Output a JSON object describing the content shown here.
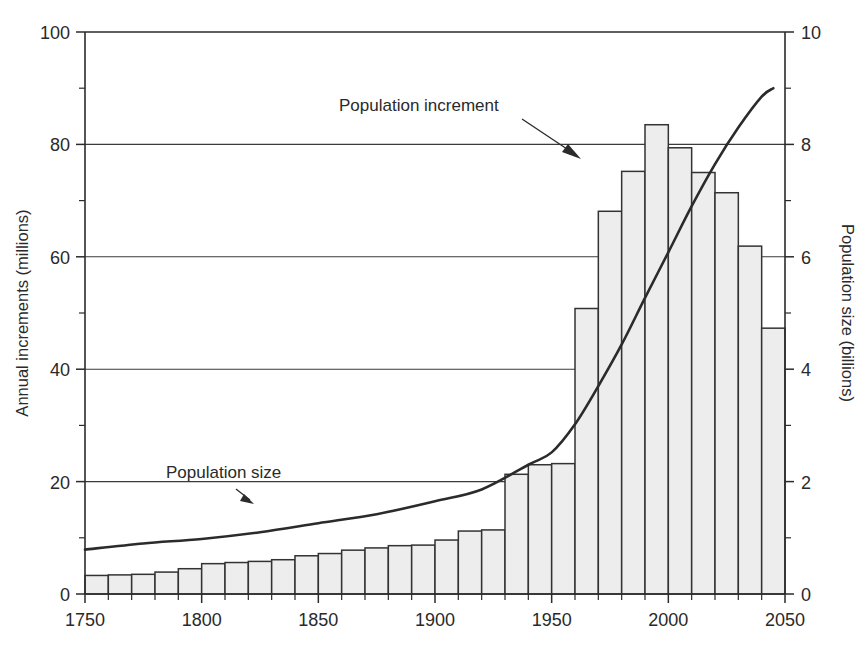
{
  "chart_data": {
    "type": "bar",
    "title": "",
    "subtitle": "",
    "xlabel": "",
    "ylabel": "Annual increments (millions)",
    "y2label": "Population size (billions)",
    "xlim": [
      1750,
      2050
    ],
    "ylim": [
      0,
      100
    ],
    "y2lim": [
      0,
      10
    ],
    "grid": true,
    "legend_position": "annotations-on-plot",
    "x_ticks": [
      1750,
      1800,
      1850,
      1900,
      1950,
      2000,
      2050
    ],
    "x_tick_labels": [
      "1750",
      "1800",
      "1850",
      "1900",
      "1950",
      "2000",
      "2050"
    ],
    "x_minor_tick_step": 10,
    "y_ticks": [
      0,
      20,
      40,
      60,
      80,
      100
    ],
    "y_tick_labels": [
      "0",
      "20",
      "40",
      "60",
      "80",
      "100"
    ],
    "y_minor_ticks": [
      10,
      30,
      50,
      70,
      90
    ],
    "y2_ticks": [
      0,
      2,
      4,
      6,
      8,
      10
    ],
    "y2_tick_labels": [
      "0",
      "2",
      "4",
      "6",
      "8",
      "10"
    ],
    "y2_minor_ticks": [
      1,
      3,
      5,
      7,
      9
    ],
    "bar_width_years": 10,
    "series": [
      {
        "name": "Population increment",
        "type": "bar",
        "axis": "left",
        "unit": "millions per year",
        "fill_color": "#ededed",
        "edge_color": "#333333",
        "categories": [
          1750,
          1760,
          1770,
          1780,
          1790,
          1800,
          1810,
          1820,
          1830,
          1840,
          1850,
          1860,
          1870,
          1880,
          1890,
          1900,
          1910,
          1920,
          1930,
          1940,
          1950,
          1960,
          1970,
          1980,
          1990,
          2000,
          2010,
          2020,
          2030,
          2040
        ],
        "values": [
          3.3,
          3.4,
          3.5,
          3.9,
          4.5,
          5.4,
          5.6,
          5.8,
          6.1,
          6.8,
          7.2,
          7.8,
          8.2,
          8.6,
          8.7,
          9.6,
          11.2,
          11.4,
          21.3,
          23.0,
          23.2,
          50.8,
          68.1,
          75.2,
          83.5,
          79.4,
          75.0,
          71.4,
          61.9,
          47.3
        ],
        "last_partial_value": 34.2,
        "last_partial_category": 2040
      },
      {
        "name": "Population size",
        "type": "line",
        "axis": "right",
        "unit": "billions",
        "line_color": "#2b2b2b",
        "x": [
          1750,
          1775,
          1800,
          1825,
          1850,
          1875,
          1900,
          1920,
          1940,
          1950,
          1960,
          1970,
          1980,
          1990,
          2000,
          2010,
          2020,
          2030,
          2040,
          2045
        ],
        "y": [
          0.79,
          0.9,
          0.98,
          1.1,
          1.26,
          1.42,
          1.65,
          1.86,
          2.3,
          2.52,
          3.02,
          3.7,
          4.44,
          5.27,
          6.08,
          6.9,
          7.65,
          8.3,
          8.85,
          9.0
        ]
      }
    ],
    "annotations": [
      {
        "text": "Population increment",
        "target_series": "Population increment",
        "arrow": "down-right"
      },
      {
        "text": "Population size",
        "target_series": "Population size",
        "arrow": "down-right"
      }
    ]
  },
  "axes": {
    "left": {
      "title": "Annual increments (millions)",
      "ticks": [
        "0",
        "20",
        "40",
        "60",
        "80",
        "100"
      ]
    },
    "right": {
      "title": "Population size (billions)",
      "ticks": [
        "0",
        "2",
        "4",
        "6",
        "8",
        "10"
      ]
    },
    "bottom": {
      "title": "",
      "ticks": [
        "1750",
        "1800",
        "1850",
        "1900",
        "1950",
        "2000",
        "2050"
      ]
    }
  },
  "annotations": {
    "increment_label": "Population increment",
    "size_label": "Population size"
  },
  "colors": {
    "bar_fill": "#ededed",
    "bar_edge": "#333333",
    "line": "#2b2b2b",
    "grid": "#3a3a3a",
    "text": "#2a2a2a",
    "background": "#ffffff"
  }
}
